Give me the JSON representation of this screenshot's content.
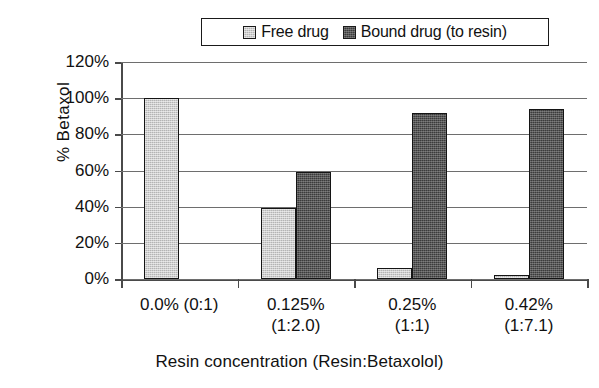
{
  "chart_data": {
    "type": "bar",
    "title": "",
    "xlabel": "Resin concentration (Resin:Betaxolol)",
    "ylabel": "%  Betaxol",
    "ylim": [
      0,
      120
    ],
    "ytick_step": 20,
    "ytick_labels": [
      "120%",
      "100%",
      "80%",
      "60%",
      "40%",
      "20%",
      "0%"
    ],
    "ytick_values": [
      120,
      100,
      80,
      60,
      40,
      20,
      0
    ],
    "grid": true,
    "legend_position": "top-center",
    "categories": [
      "0.0% (0:1)",
      "0.125%\n(1:2.0)",
      "0.25%\n(1:1)",
      "0.42%\n(1:7.1)"
    ],
    "category_lines": [
      [
        "0.0% (0:1)",
        ""
      ],
      [
        "0.125%",
        "(1:2.0)"
      ],
      [
        "0.25%",
        "(1:1)"
      ],
      [
        "0.42%",
        "(1:7.1)"
      ]
    ],
    "series": [
      {
        "name": "Free drug",
        "color": "#b4b4b4",
        "values": [
          100,
          39,
          6,
          2
        ]
      },
      {
        "name": "Bound drug (to resin)",
        "color": "#3b3b3b",
        "values": [
          0,
          59,
          92,
          94
        ]
      }
    ]
  },
  "legend": {
    "entries": [
      {
        "label": "Free drug",
        "swatch": "light-gray-swatch"
      },
      {
        "label": "Bound drug (to resin)",
        "swatch": "dark-gray-swatch"
      }
    ]
  },
  "axes": {
    "y_title": "%  Betaxol",
    "x_title": "Resin concentration (Resin:Betaxolol)"
  },
  "colors": {
    "free_drug": "#b4b4b4",
    "bound_drug": "#3b3b3b",
    "axis": "#4a4a4a",
    "grid": "#6e6e6e",
    "text": "#111111",
    "background": "#ffffff"
  }
}
